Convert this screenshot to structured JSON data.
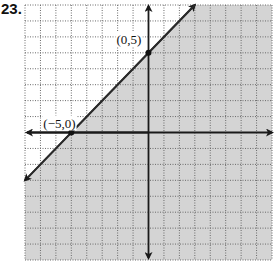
{
  "problem": {
    "number": "23."
  },
  "chart_data": {
    "type": "line",
    "title": "",
    "xlabel": "x",
    "ylabel": "y",
    "xlim": [
      -8,
      8
    ],
    "ylim": [
      -8,
      8
    ],
    "grid": true,
    "grid_style": "dotted",
    "series": [
      {
        "name": "boundary line y = x + 5",
        "equation": "y = x + 5",
        "style": "solid",
        "x": [
          -8,
          3
        ],
        "y": [
          -3,
          8
        ]
      }
    ],
    "shaded_region": {
      "description": "half-plane below/right of the line",
      "inequality": "y <= x + 5",
      "color": "#d4d4d4"
    },
    "points": [
      {
        "x": -5,
        "y": 0,
        "label": "(−5,0)"
      },
      {
        "x": 0,
        "y": 5,
        "label": "(0,5)"
      }
    ],
    "annotations": []
  },
  "colors": {
    "shade": "#d4d4d4",
    "grid": "#6a6a6a",
    "axis": "#1a1a1a",
    "line": "#2a2a2a"
  }
}
